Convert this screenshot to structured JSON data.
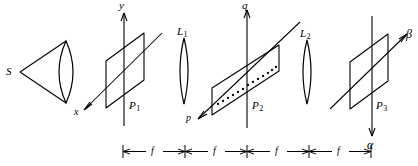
{
  "figure": {
    "type": "optical-diagram",
    "background_color": "#ffffff",
    "stroke_color": "#000000"
  },
  "source": {
    "label": "S",
    "name": "point-source"
  },
  "condenser_lens": {
    "name": "condenser-lens",
    "label": ""
  },
  "lenses": [
    {
      "label": "L",
      "subscript": "1",
      "name": "lens-L1"
    },
    {
      "label": "L",
      "subscript": "2",
      "name": "lens-L2"
    }
  ],
  "planes": [
    {
      "label": "P",
      "subscript": "1",
      "name": "plane-P1",
      "axis_vertical": "y",
      "axis_diagonal": "x",
      "has_dots": false
    },
    {
      "label": "P",
      "subscript": "2",
      "name": "plane-P2",
      "axis_vertical": "q",
      "axis_diagonal": "p",
      "has_dots": true,
      "dot_count": 13
    },
    {
      "label": "P",
      "subscript": "3",
      "name": "plane-P3",
      "axis_vertical": "α",
      "axis_diagonal": "β",
      "has_dots": false
    }
  ],
  "dimension_bar": {
    "name": "focal-length-scale",
    "segments": [
      {
        "label": "f"
      },
      {
        "label": "f"
      },
      {
        "label": "f"
      },
      {
        "label": "f"
      }
    ],
    "tick_count": 5
  }
}
